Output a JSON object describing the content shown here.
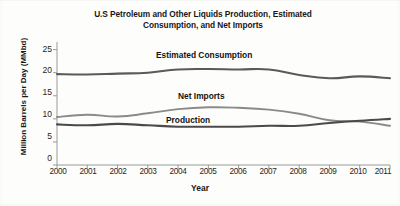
{
  "chart_data": {
    "type": "line",
    "title": "U.S Petroleum and Other Liquids Production, Estimated Consumption, and Net Imports",
    "title_line1": "U.S Petroleum and Other Liquids Production, Estimated",
    "title_line2": "Consumption, and Net Imports",
    "xlabel": "Year",
    "ylabel": "Million Barrels per Day (MMbd)",
    "x": [
      2000,
      2001,
      2002,
      2003,
      2004,
      2005,
      2006,
      2007,
      2008,
      2009,
      2010,
      2011
    ],
    "xtick_labels": [
      "2000",
      "2001",
      "2002",
      "2003",
      "2004",
      "2005",
      "2006",
      "2007",
      "2008",
      "2009",
      "2010",
      "2011"
    ],
    "ytick_labels": [
      "0",
      "5",
      "10",
      "15",
      "20",
      "25"
    ],
    "ytick_values": [
      0,
      5,
      10,
      15,
      20,
      25
    ],
    "ylim": [
      0,
      26
    ],
    "xlim": [
      2000,
      2011
    ],
    "grid": false,
    "legend_position": "inline-annotations",
    "series": [
      {
        "name": "Estimated Consumption",
        "color": "#5a5a5a",
        "values": [
          19.7,
          19.6,
          19.8,
          20.0,
          20.7,
          20.8,
          20.7,
          20.7,
          19.5,
          18.8,
          19.2,
          18.8
        ]
      },
      {
        "name": "Net Imports",
        "color": "#8a8a8a",
        "values": [
          10.4,
          10.9,
          10.5,
          11.2,
          12.1,
          12.5,
          12.4,
          12.0,
          11.1,
          9.7,
          9.4,
          8.5
        ]
      },
      {
        "name": "Production",
        "color": "#4a4a4a",
        "values": [
          8.8,
          8.6,
          8.9,
          8.6,
          8.3,
          8.3,
          8.3,
          8.5,
          8.5,
          9.1,
          9.6,
          10.0
        ]
      }
    ],
    "annotations": [
      {
        "text": "Estimated Consumption",
        "x": 2004.2,
        "y": 23.2
      },
      {
        "text": "Net Imports",
        "x": 2003.9,
        "y": 14.1
      },
      {
        "text": "Production",
        "x": 2003.3,
        "y": 11.4
      }
    ]
  },
  "axis": {
    "ytick_labels": [
      "25",
      "20",
      "15",
      "10",
      "5",
      "0"
    ],
    "xtick_labels": [
      "2000",
      "2001",
      "2002",
      "2003",
      "2004",
      "2005",
      "2006",
      "2007",
      "2008",
      "2009",
      "2010",
      "2011"
    ]
  }
}
